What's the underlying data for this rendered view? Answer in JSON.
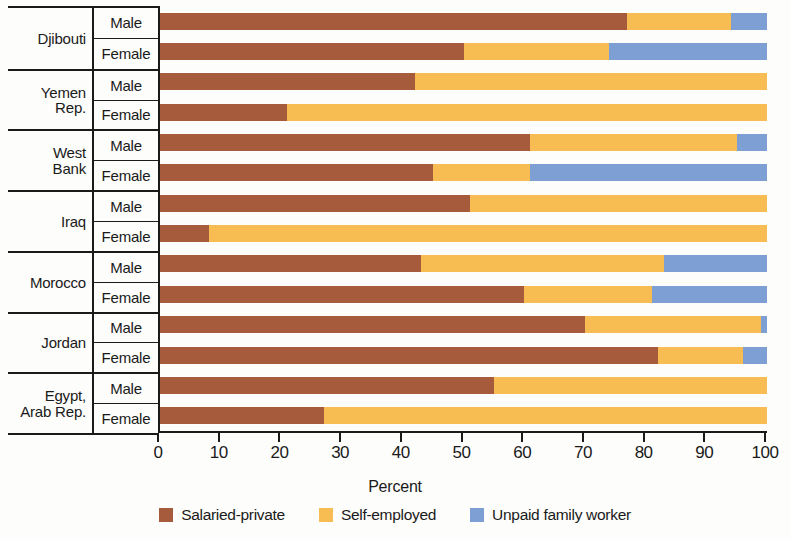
{
  "chart_data": {
    "type": "bar",
    "orientation": "horizontal",
    "stacked": true,
    "title": "",
    "xlabel": "Percent",
    "ylabel": "",
    "xlim": [
      0,
      100
    ],
    "xticks": [
      0,
      10,
      20,
      30,
      40,
      50,
      60,
      70,
      80,
      90,
      100
    ],
    "grid": false,
    "legend_position": "bottom",
    "series": [
      {
        "name": "Salaried-private",
        "color": "#a55b3c",
        "values": [
          77,
          50,
          42,
          21,
          61,
          45,
          51,
          8,
          43,
          60,
          70,
          82,
          55,
          27
        ]
      },
      {
        "name": "Self-employed",
        "color": "#f7bc52",
        "values": [
          17,
          24,
          58,
          79,
          34,
          16,
          49,
          92,
          40,
          21,
          29,
          14,
          45,
          73
        ]
      },
      {
        "name": "Unpaid family worker",
        "color": "#7e9fd4",
        "values": [
          6,
          26,
          0,
          0,
          5,
          39,
          0,
          0,
          17,
          19,
          1,
          4,
          0,
          0
        ]
      }
    ],
    "categories": [
      "Djibouti Male",
      "Djibouti Female",
      "Yemen Rep. Male",
      "Yemen Rep. Female",
      "West Bank Male",
      "West Bank Female",
      "Iraq Male",
      "Iraq Female",
      "Morocco Male",
      "Morocco Female",
      "Jordan Male",
      "Jordan Female",
      "Egypt Arab Rep. Male",
      "Egypt Arab Rep. Female"
    ],
    "groups": [
      {
        "country_lines": [
          "Djibouti"
        ],
        "rows": [
          {
            "sex": "Male",
            "salaried_private": 77,
            "self_employed": 17,
            "unpaid_family_worker": 6
          },
          {
            "sex": "Female",
            "salaried_private": 50,
            "self_employed": 24,
            "unpaid_family_worker": 26
          }
        ]
      },
      {
        "country_lines": [
          "Yemen",
          "Rep."
        ],
        "rows": [
          {
            "sex": "Male",
            "salaried_private": 42,
            "self_employed": 58,
            "unpaid_family_worker": 0
          },
          {
            "sex": "Female",
            "salaried_private": 21,
            "self_employed": 79,
            "unpaid_family_worker": 0
          }
        ]
      },
      {
        "country_lines": [
          "West",
          "Bank"
        ],
        "rows": [
          {
            "sex": "Male",
            "salaried_private": 61,
            "self_employed": 34,
            "unpaid_family_worker": 5
          },
          {
            "sex": "Female",
            "salaried_private": 45,
            "self_employed": 16,
            "unpaid_family_worker": 39
          }
        ]
      },
      {
        "country_lines": [
          "Iraq"
        ],
        "rows": [
          {
            "sex": "Male",
            "salaried_private": 51,
            "self_employed": 49,
            "unpaid_family_worker": 0
          },
          {
            "sex": "Female",
            "salaried_private": 8,
            "self_employed": 92,
            "unpaid_family_worker": 0
          }
        ]
      },
      {
        "country_lines": [
          "Morocco"
        ],
        "rows": [
          {
            "sex": "Male",
            "salaried_private": 43,
            "self_employed": 40,
            "unpaid_family_worker": 17
          },
          {
            "sex": "Female",
            "salaried_private": 60,
            "self_employed": 21,
            "unpaid_family_worker": 19
          }
        ]
      },
      {
        "country_lines": [
          "Jordan"
        ],
        "rows": [
          {
            "sex": "Male",
            "salaried_private": 70,
            "self_employed": 29,
            "unpaid_family_worker": 1
          },
          {
            "sex": "Female",
            "salaried_private": 82,
            "self_employed": 14,
            "unpaid_family_worker": 4
          }
        ]
      },
      {
        "country_lines": [
          "Egypt,",
          "Arab Rep."
        ],
        "rows": [
          {
            "sex": "Male",
            "salaried_private": 55,
            "self_employed": 45,
            "unpaid_family_worker": 0
          },
          {
            "sex": "Female",
            "salaried_private": 27,
            "self_employed": 73,
            "unpaid_family_worker": 0
          }
        ]
      }
    ]
  },
  "legend": {
    "items": [
      {
        "label": "Salaried-private",
        "color": "#a55b3c"
      },
      {
        "label": "Self-employed",
        "color": "#f7bc52"
      },
      {
        "label": "Unpaid family worker",
        "color": "#7e9fd4"
      }
    ]
  },
  "axis": {
    "x_title": "Percent",
    "tick_labels": [
      "0",
      "10",
      "20",
      "30",
      "40",
      "50",
      "60",
      "70",
      "80",
      "90",
      "100"
    ]
  }
}
